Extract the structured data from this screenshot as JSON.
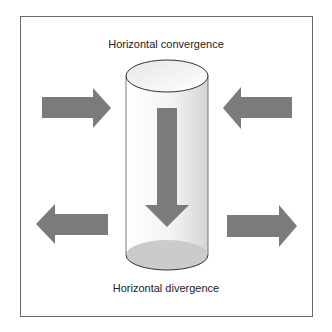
{
  "diagram": {
    "top_label": "Horizontal convergence",
    "bottom_label": "Horizontal divergence",
    "colors": {
      "arrow": "#7b7b7b",
      "frame": "#6a6a6a",
      "cylinder_outline": "#333333",
      "cylinder_base": "#c9c9c9",
      "cylinder_side_light": "#ffffff",
      "cylinder_side_dark": "#d6d6d6"
    },
    "elements": [
      {
        "name": "convergence-arrow-left",
        "direction": "right",
        "meaning": "air flowing in from the left at top"
      },
      {
        "name": "convergence-arrow-right",
        "direction": "left",
        "meaning": "air flowing in from the right at top"
      },
      {
        "name": "sinking-arrow",
        "direction": "down",
        "meaning": "air sinking inside the column"
      },
      {
        "name": "divergence-arrow-left",
        "direction": "left",
        "meaning": "air flowing out to the left at bottom"
      },
      {
        "name": "divergence-arrow-right",
        "direction": "right",
        "meaning": "air flowing out to the right at bottom"
      },
      {
        "name": "air-column",
        "shape": "cylinder",
        "meaning": "vertical column of air"
      }
    ]
  }
}
